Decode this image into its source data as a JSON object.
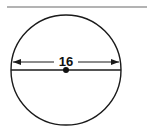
{
  "diagram": {
    "type": "circle-with-diameter",
    "diameter_label": "16",
    "colors": {
      "stroke": "#1a1a1a",
      "rule": "#9a9a9a",
      "background": "#ffffff"
    }
  }
}
